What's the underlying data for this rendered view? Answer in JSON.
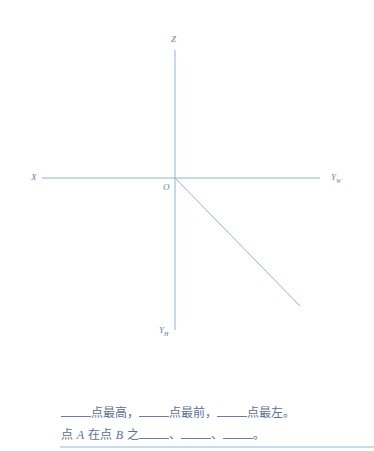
{
  "diagram": {
    "axes": {
      "z": {
        "label": "Z"
      },
      "x": {
        "label": "X"
      },
      "yw": {
        "label": "Y",
        "sub": "W"
      },
      "yh": {
        "label": "Y",
        "sub": "H"
      },
      "origin": {
        "label": "O"
      }
    },
    "line_color": "#8fb3dc"
  },
  "questions": {
    "line1": {
      "p1": "点最高，",
      "p2": "点最前，",
      "p3": "点最左。"
    },
    "line2": {
      "a": "点",
      "pointA": "A",
      "b": "在点",
      "pointB": "B",
      "c": "之",
      "sep1": "、",
      "sep2": "、",
      "end": "。"
    }
  }
}
